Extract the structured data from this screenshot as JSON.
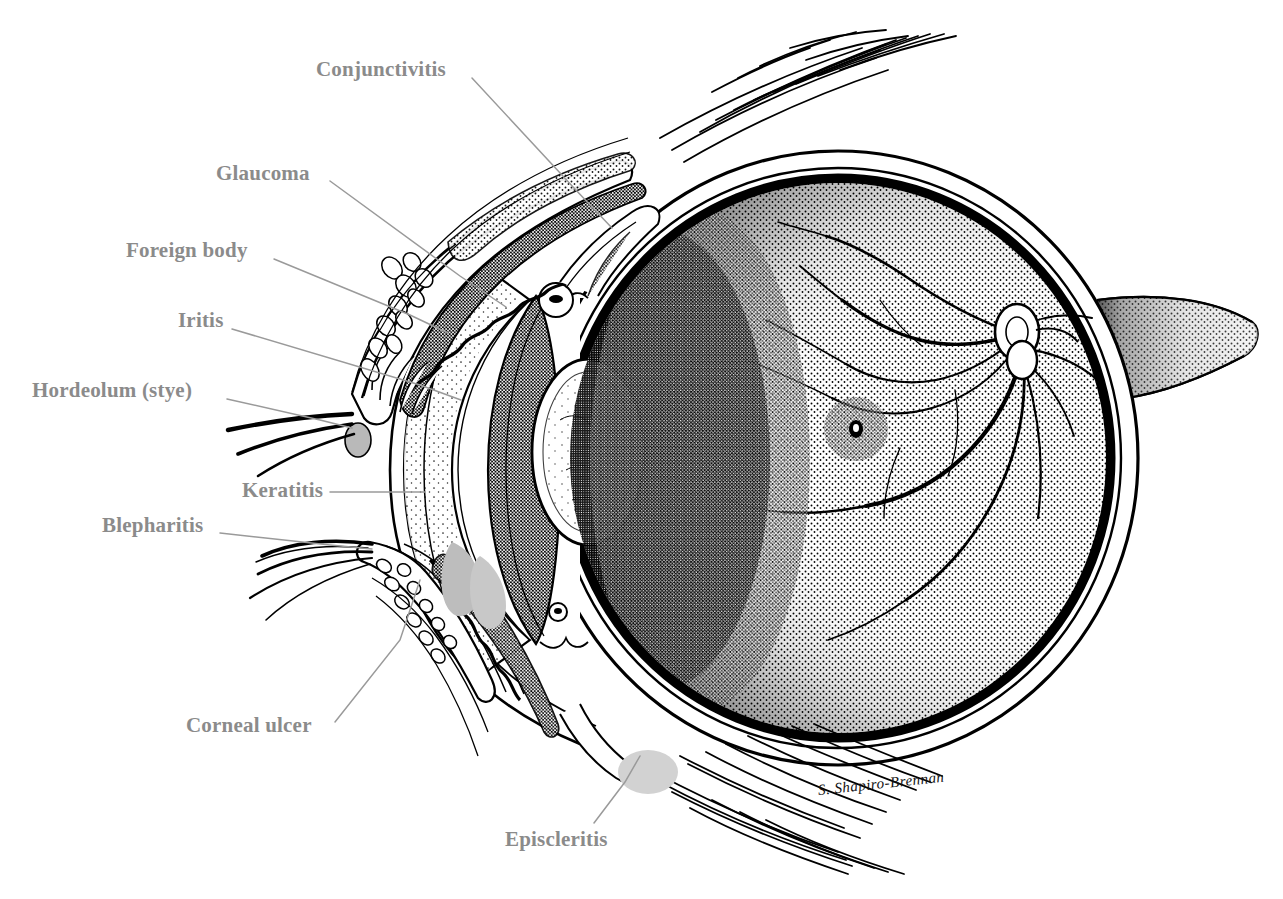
{
  "figure": {
    "title": "RED EYE",
    "type": "anatomical-illustration",
    "medium": "pen-and-ink stipple drawing",
    "signature": "S. Shapiro-Brennan",
    "background_color": "#ffffff",
    "ink_color": "#000000",
    "label_color": "#8b8b8b",
    "leader_color": "#9a9a9a"
  },
  "labels": [
    {
      "id": "conjunctivitis",
      "text": "Conjunctivitis",
      "x": 316,
      "y": 59,
      "leader": [
        [
          472,
          78
        ],
        [
          574,
          188
        ],
        [
          612,
          228
        ]
      ]
    },
    {
      "id": "glaucoma",
      "text": "Glaucoma",
      "x": 216,
      "y": 163,
      "leader": [
        [
          330,
          181
        ],
        [
          460,
          276
        ],
        [
          506,
          307
        ]
      ]
    },
    {
      "id": "foreign-body",
      "text": "Foreign body",
      "x": 126,
      "y": 240,
      "leader": [
        [
          274,
          259
        ],
        [
          410,
          315
        ],
        [
          448,
          333
        ]
      ]
    },
    {
      "id": "iritis",
      "text": "Iritis",
      "x": 178,
      "y": 310,
      "leader": [
        [
          232,
          329
        ],
        [
          420,
          385
        ],
        [
          461,
          400
        ]
      ]
    },
    {
      "id": "hordeolum-stye",
      "text": "Hordeolum (stye)",
      "x": 32,
      "y": 380,
      "leader": [
        [
          227,
          399
        ],
        [
          320,
          420
        ],
        [
          352,
          428
        ]
      ]
    },
    {
      "id": "keratitis",
      "text": "Keratitis",
      "x": 242,
      "y": 480,
      "leader": [
        [
          330,
          492
        ],
        [
          400,
          492
        ],
        [
          425,
          492
        ]
      ]
    },
    {
      "id": "blepharitis",
      "text": "Blepharitis",
      "x": 102,
      "y": 515,
      "leader": [
        [
          220,
          533
        ],
        [
          330,
          545
        ],
        [
          372,
          549
        ]
      ]
    },
    {
      "id": "corneal-ulcer",
      "text": "Corneal ulcer",
      "x": 186,
      "y": 715,
      "leader": [
        [
          335,
          722
        ],
        [
          400,
          640
        ],
        [
          420,
          580
        ]
      ]
    },
    {
      "id": "episcleritis",
      "text": "Episcleritis",
      "x": 505,
      "y": 829,
      "leader": [
        [
          594,
          823
        ],
        [
          625,
          782
        ],
        [
          640,
          756
        ]
      ]
    }
  ],
  "anatomy": {
    "globe": {
      "center_x": 838,
      "center_y": 458,
      "radius_x": 300,
      "radius_y": 307,
      "sclera_label": "sclera-outer-wall",
      "choroid_label": "choroid-dark-band",
      "retina_label": "retina-stippled-field"
    },
    "cornea": {
      "label": "cornea",
      "apex_x": 404,
      "apex_y": 470
    },
    "lens": {
      "label": "lens",
      "cx": 585,
      "cy": 450,
      "rx": 55,
      "ry": 92
    },
    "iris": {
      "label": "iris"
    },
    "anterior_chamber": {
      "label": "anterior-chamber"
    },
    "optic_nerve": {
      "label": "optic-nerve",
      "exit_x": 1135,
      "exit_y": 355
    },
    "optic_disc": {
      "label": "optic-disc",
      "cx": 1017,
      "cy": 330
    },
    "macula": {
      "label": "macula-fovea",
      "cx": 855,
      "cy": 428
    },
    "upper_eyelid": {
      "label": "upper-eyelid",
      "lashes": 16
    },
    "lower_eyelid": {
      "label": "lower-eyelid",
      "lashes": 5
    },
    "meibomian_glands_upper": {
      "label": "meibomian-glands-upper",
      "count": 11
    },
    "meibomian_glands_lower": {
      "label": "meibomian-glands-lower",
      "count": 11
    },
    "extraocular_muscle_superior": {
      "label": "superior-rectus-muscle"
    },
    "extraocular_muscle_inferior": {
      "label": "inferior-rectus-muscle"
    },
    "retinal_vessels": {
      "label": "retinal-blood-vessels",
      "branches": 9
    }
  },
  "conditions_depicted": [
    "Conjunctivitis",
    "Glaucoma",
    "Foreign body",
    "Iritis",
    "Hordeolum (stye)",
    "Keratitis",
    "Blepharitis",
    "Corneal ulcer",
    "Episcleritis"
  ]
}
